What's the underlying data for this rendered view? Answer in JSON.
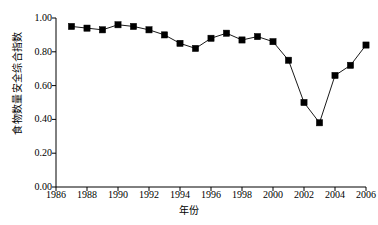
{
  "chart_data": {
    "type": "line",
    "title": "",
    "xlabel": "年份",
    "ylabel": "食物数量安全综合指数",
    "xlim": [
      1986,
      2006
    ],
    "ylim": [
      0.0,
      1.0
    ],
    "grid": false,
    "legend": "none",
    "marker": "filled-square",
    "line_color": "#000000",
    "marker_color": "#000000",
    "xticks": [
      "1986",
      "1988",
      "1990",
      "1992",
      "1994",
      "1996",
      "1998",
      "2000",
      "2002",
      "2004",
      "2006"
    ],
    "xtick_values": [
      1986,
      1988,
      1990,
      1992,
      1994,
      1996,
      1998,
      2000,
      2002,
      2004,
      2006
    ],
    "yticks": [
      "0.00",
      "0.20",
      "0.40",
      "0.60",
      "0.80",
      "1.00"
    ],
    "ytick_values": [
      0.0,
      0.2,
      0.4,
      0.6,
      0.8,
      1.0
    ],
    "x": [
      1987,
      1988,
      1989,
      1990,
      1991,
      1992,
      1993,
      1994,
      1995,
      1996,
      1997,
      1998,
      1999,
      2000,
      2001,
      2002,
      2003,
      2004,
      2005,
      2006
    ],
    "values": [
      0.95,
      0.94,
      0.93,
      0.96,
      0.95,
      0.93,
      0.9,
      0.85,
      0.82,
      0.88,
      0.91,
      0.87,
      0.89,
      0.86,
      0.75,
      0.5,
      0.38,
      0.66,
      0.72,
      0.84
    ],
    "series": [
      {
        "name": "食物数量安全综合指数",
        "values": [
          0.95,
          0.94,
          0.93,
          0.96,
          0.95,
          0.93,
          0.9,
          0.85,
          0.82,
          0.88,
          0.91,
          0.87,
          0.89,
          0.86,
          0.75,
          0.5,
          0.38,
          0.66,
          0.72,
          0.84
        ]
      }
    ]
  }
}
